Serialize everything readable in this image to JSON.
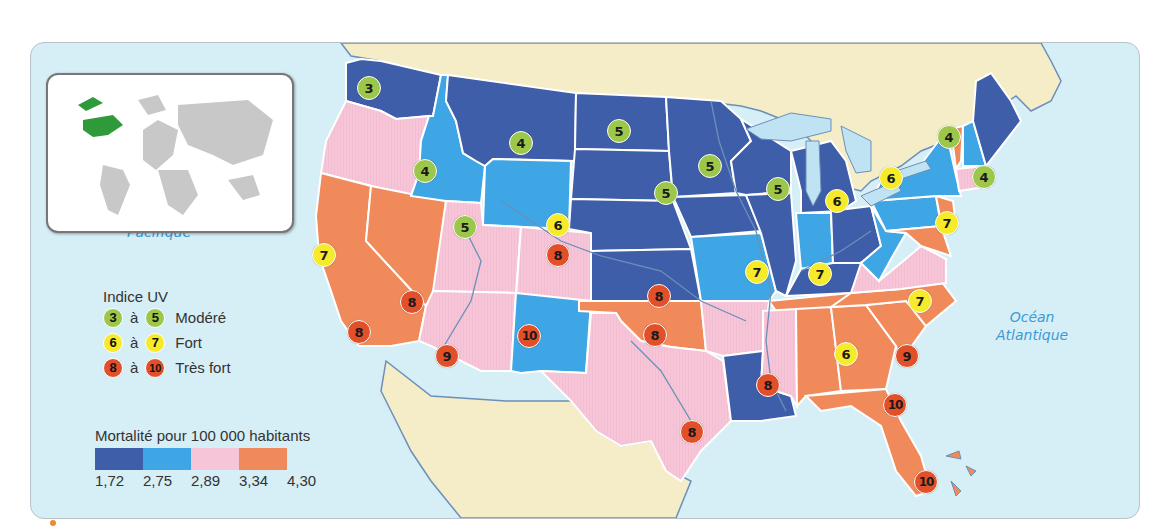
{
  "inset": {
    "label": "World locator map",
    "highlight": "United States"
  },
  "oceans": {
    "pacific": {
      "line1": "Océan",
      "line2": "Pacifique"
    },
    "atlantic": {
      "line1": "Océan",
      "line2": "Atlantique"
    }
  },
  "legend": {
    "uv_title": "Indice UV",
    "uv_classes": [
      {
        "from": "3",
        "sep": "à",
        "to": "5",
        "label": "Modéré",
        "color": "#9cc74a"
      },
      {
        "from": "6",
        "sep": "à",
        "to": "7",
        "label": "Fort",
        "color": "#f6ea2a"
      },
      {
        "from": "8",
        "sep": "à",
        "to": "10",
        "label": "Très fort",
        "color": "#e2502a"
      }
    ],
    "mortality_title": "Mortalité pour 100 000 habitants",
    "mortality_colors": [
      "#3f5eaa",
      "#3ea6e4",
      "#f6c6d8",
      "#f08a5a"
    ],
    "mortality_ticks": [
      "1,72",
      "2,75",
      "2,89",
      "3,34",
      "4,30"
    ]
  },
  "colors": {
    "ocean": "#d6eef6",
    "land_other": "#f5ecc8",
    "c1": "#3f5eaa",
    "c2": "#3ea6e4",
    "c3": "#f6c6d8",
    "c4": "#f08a5a",
    "lake": "#bfe3f2",
    "river": "#6b8fb8"
  },
  "markers": [
    {
      "state": "WA",
      "value": "3",
      "x": 368,
      "y": 87
    },
    {
      "state": "MT",
      "value": "4",
      "x": 520,
      "y": 142
    },
    {
      "state": "ID",
      "value": "4",
      "x": 424,
      "y": 170
    },
    {
      "state": "ND",
      "value": "5",
      "x": 618,
      "y": 130
    },
    {
      "state": "MN",
      "value": "5",
      "x": 709,
      "y": 165
    },
    {
      "state": "SD/IA",
      "value": "5",
      "x": 665,
      "y": 192
    },
    {
      "state": "WI",
      "value": "5",
      "x": 777,
      "y": 188
    },
    {
      "state": "MI",
      "value": "6",
      "x": 836,
      "y": 200
    },
    {
      "state": "NY",
      "value": "6",
      "x": 890,
      "y": 177
    },
    {
      "state": "VT",
      "value": "4",
      "x": 948,
      "y": 136
    },
    {
      "state": "MA",
      "value": "4",
      "x": 983,
      "y": 176
    },
    {
      "state": "NJ",
      "value": "7",
      "x": 946,
      "y": 222
    },
    {
      "state": "UT",
      "value": "5",
      "x": 464,
      "y": 226
    },
    {
      "state": "WY/CO",
      "value": "6",
      "x": 557,
      "y": 224
    },
    {
      "state": "CO",
      "value": "8",
      "x": 557,
      "y": 254
    },
    {
      "state": "CA-N",
      "value": "7",
      "x": 323,
      "y": 254
    },
    {
      "state": "MO",
      "value": "7",
      "x": 756,
      "y": 271
    },
    {
      "state": "KY",
      "value": "7",
      "x": 819,
      "y": 273
    },
    {
      "state": "KS",
      "value": "8",
      "x": 658,
      "y": 295
    },
    {
      "state": "NC",
      "value": "7",
      "x": 919,
      "y": 300
    },
    {
      "state": "NV/CA",
      "value": "8",
      "x": 411,
      "y": 301
    },
    {
      "state": "CA-S",
      "value": "8",
      "x": 358,
      "y": 331
    },
    {
      "state": "NM",
      "value": "10",
      "x": 528,
      "y": 335
    },
    {
      "state": "OK",
      "value": "8",
      "x": 654,
      "y": 334
    },
    {
      "state": "AZ",
      "value": "9",
      "x": 446,
      "y": 355
    },
    {
      "state": "GA/AL",
      "value": "6",
      "x": 845,
      "y": 353
    },
    {
      "state": "SC",
      "value": "9",
      "x": 906,
      "y": 355
    },
    {
      "state": "MS",
      "value": "8",
      "x": 767,
      "y": 384
    },
    {
      "state": "FL-N",
      "value": "10",
      "x": 894,
      "y": 404
    },
    {
      "state": "TX",
      "value": "8",
      "x": 691,
      "y": 431
    },
    {
      "state": "FL-S",
      "value": "10",
      "x": 925,
      "y": 481
    }
  ]
}
